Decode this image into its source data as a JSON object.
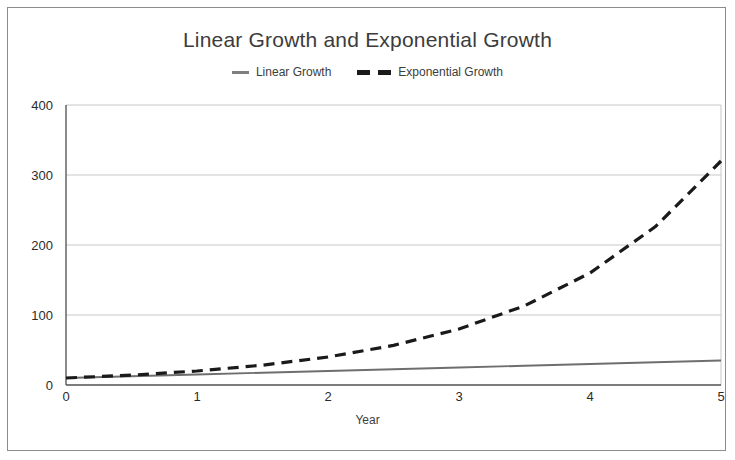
{
  "chart_data": {
    "type": "line",
    "title": "Linear Growth and Exponential Growth",
    "xlabel": "Year",
    "ylabel": "",
    "xlim": [
      0,
      5
    ],
    "ylim": [
      0,
      400
    ],
    "xticks": [
      0,
      1,
      2,
      3,
      4,
      5
    ],
    "yticks": [
      0,
      100,
      200,
      300,
      400
    ],
    "xtick_labels": [
      "0",
      "1",
      "2",
      "3",
      "4",
      "5"
    ],
    "ytick_labels": [
      "0",
      "100",
      "200",
      "300",
      "400"
    ],
    "grid": true,
    "grid_axis": "y",
    "legend_position": "top-center",
    "x": [
      0,
      0.5,
      1,
      1.5,
      2,
      2.5,
      3,
      3.5,
      4,
      4.5,
      5
    ],
    "series": [
      {
        "name": "Linear Growth",
        "style": "solid",
        "color": "#6e6e6e",
        "values": [
          10,
          12.5,
          15,
          17.5,
          20,
          22.5,
          25,
          27.5,
          30,
          32.5,
          35
        ]
      },
      {
        "name": "Exponential Growth",
        "style": "dashed",
        "color": "#1a1a1a",
        "values": [
          10,
          14.1,
          20,
          28.3,
          40,
          56.6,
          80,
          113.1,
          160,
          226.3,
          320
        ]
      }
    ]
  },
  "legend": {
    "items": [
      {
        "label": "Linear Growth",
        "marker": "solid-line-swatch",
        "color": "#7f7f7f"
      },
      {
        "label": "Exponential Growth",
        "marker": "dashed-line-swatch",
        "color": "#1a1a1a"
      }
    ]
  },
  "colors": {
    "linear": "#6e6e6e",
    "exponential": "#1a1a1a",
    "axis": "#5a5a5a",
    "grid": "#c8c8c8",
    "frame": "#8c8c8c",
    "text": "#333333",
    "background": "#ffffff"
  }
}
